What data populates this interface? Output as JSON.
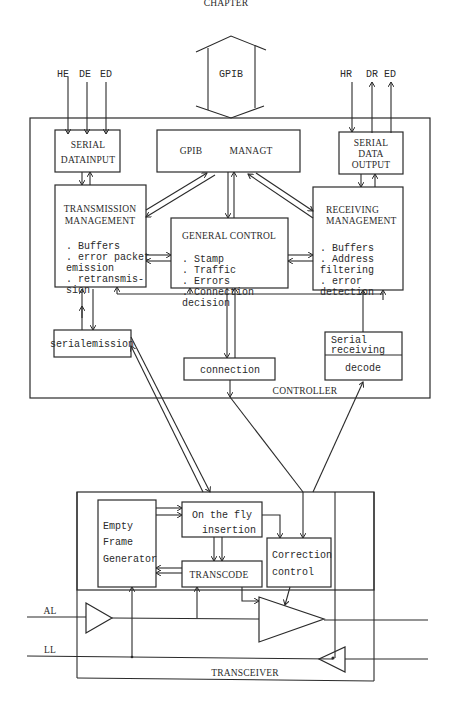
{
  "page_header": "CHAPTER",
  "inputs_left": [
    "HE",
    "DE",
    "ED"
  ],
  "inputs_right": [
    "HR",
    "DR",
    "ED"
  ],
  "bus": {
    "label": "GPIB"
  },
  "controller": {
    "label": "CONTROLLER",
    "serial_data_input": {
      "line1": "SERIAL",
      "line2": "DATAINPUT"
    },
    "gpib_managt": {
      "word1": "GPIB",
      "word2": "MANAGT"
    },
    "serial_data_output": {
      "line1": "SERIAL",
      "line2": "DATA",
      "line3": "OUTPUT"
    },
    "transmission_management": {
      "title1": "TRANSMISSION",
      "title2": "MANAGEMENT",
      "items": [
        ". Buffers",
        ". error packet",
        "  emission",
        ". retransmis-",
        "  sion"
      ]
    },
    "general_control": {
      "title": "GENERAL  CONTROL",
      "items": [
        ". Stamp",
        ". Traffic",
        ". Errors",
        ". Connection",
        "  decision"
      ]
    },
    "receiving_management": {
      "title1": "RECEIVING",
      "title2": "MANAGEMENT",
      "items": [
        ". Buffers",
        ". Address",
        "  filtering",
        ". error",
        "  detection"
      ]
    },
    "serial_emission": {
      "label": "serialemission"
    },
    "connection": {
      "label": "connection"
    },
    "serial_receiving": {
      "line1": "Serial",
      "line2": "receiving",
      "decode": "decode"
    }
  },
  "transceiver": {
    "label": "TRANSCEIVER",
    "empty_frame_generator": {
      "line1": "Empty",
      "line2": "Frame",
      "line3": "Generator"
    },
    "on_the_fly_insertion": {
      "line1": "On the fly",
      "line2": "insertion"
    },
    "transcode": {
      "label": "TRANSCODE"
    },
    "correction_control": {
      "line1": "Correction",
      "line2": "control"
    },
    "lines": [
      "AL",
      "LL"
    ]
  }
}
